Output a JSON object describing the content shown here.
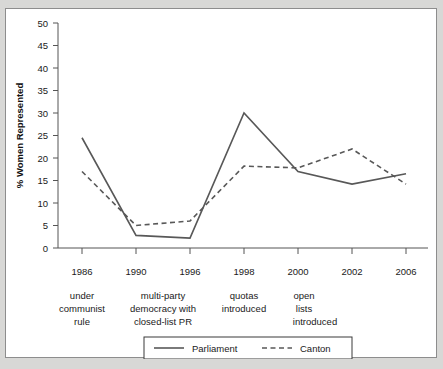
{
  "chart_data": {
    "type": "line",
    "title": "",
    "xlabel": "",
    "ylabel": "% Women Represented",
    "ylim": [
      0,
      50
    ],
    "ytick_step": 5,
    "grid": false,
    "legend_position": "bottom",
    "categories": [
      "1986",
      "1990",
      "1996",
      "1998",
      "2000",
      "2002",
      "2006"
    ],
    "yticks": [
      "0",
      "5",
      "10",
      "15",
      "20",
      "25",
      "30",
      "35",
      "40",
      "45",
      "50"
    ],
    "series": [
      {
        "name": "Parliament",
        "style": "solid",
        "color": "#585858",
        "values": [
          24.5,
          2.8,
          2.2,
          30.0,
          17.0,
          14.2,
          16.5
        ]
      },
      {
        "name": "Canton",
        "style": "dashed",
        "color": "#585858",
        "values": [
          17.0,
          5.0,
          6.0,
          18.2,
          17.8,
          22.0,
          14.2
        ]
      }
    ],
    "annotations": [
      {
        "id": "annotation-communist-rule",
        "lines": [
          "under",
          "communist",
          "rule"
        ],
        "anchor_category": "1986"
      },
      {
        "id": "annotation-multiparty-democracy",
        "lines": [
          "multi-party",
          "democracy with",
          "closed-list PR"
        ],
        "anchor_category": "1993"
      },
      {
        "id": "annotation-quotas-introduced",
        "lines": [
          "quotas",
          "introduced"
        ],
        "anchor_category": "1998"
      },
      {
        "id": "annotation-open-lists-introduced",
        "lines": [
          "open",
          "lists",
          "introduced"
        ],
        "anchor_category": "2000"
      }
    ]
  },
  "axis": {
    "y_title": "% Women Represented",
    "y_ticks": {
      "t0": "0",
      "t1": "5",
      "t2": "10",
      "t3": "15",
      "t4": "20",
      "t5": "25",
      "t6": "30",
      "t7": "35",
      "t8": "40",
      "t9": "45",
      "t10": "50"
    },
    "x_ticks": {
      "t0": "1986",
      "t1": "1990",
      "t2": "1996",
      "t3": "1998",
      "t4": "2000",
      "t5": "2002",
      "t6": "2006"
    }
  },
  "annotations": {
    "communist": {
      "l0": "under",
      "l1": "communist",
      "l2": "rule"
    },
    "multiparty": {
      "l0": "multi-party",
      "l1": "democracy with",
      "l2": "closed-list PR"
    },
    "quotas": {
      "l0": "quotas",
      "l1": "introduced"
    },
    "openlists": {
      "l0": "open",
      "l1": "lists",
      "l2": "introduced"
    }
  },
  "legend": {
    "items": {
      "parliament": "Parliament",
      "canton": "Canton"
    }
  }
}
